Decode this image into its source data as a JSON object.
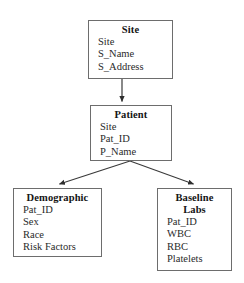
{
  "diagram": {
    "background_color": "#ffffff",
    "line_color": "#3a3a3a",
    "border_color": "#6d6d6d",
    "text_color": "#1a1a1a",
    "entities": [
      {
        "id": "site",
        "title": "Site",
        "title_lines": [
          "Site"
        ],
        "attributes": [
          "Site",
          "S_Name",
          "S_Address"
        ]
      },
      {
        "id": "patient",
        "title": "Patient",
        "title_lines": [
          "Patient"
        ],
        "attributes": [
          "Site",
          "Pat_ID",
          "P_Name"
        ]
      },
      {
        "id": "demographic",
        "title": "Demographic",
        "title_lines": [
          "Demographic"
        ],
        "attributes": [
          "Pat_ID",
          "Sex",
          "Race",
          "Risk Factors"
        ]
      },
      {
        "id": "baseline_labs",
        "title": "Baseline Labs",
        "title_lines": [
          "Baseline",
          "Labs"
        ],
        "attributes": [
          "Pat_ID",
          "WBC",
          "RBC",
          "Platelets"
        ]
      }
    ],
    "edges": [
      {
        "id": "site-to-patient",
        "from": "site",
        "to": "patient",
        "arrowhead": "filled-triangle"
      },
      {
        "id": "patient-to-demographic",
        "from": "patient",
        "to": "demographic",
        "arrowhead": "filled-triangle"
      },
      {
        "id": "patient-to-baseline-labs",
        "from": "patient",
        "to": "baseline_labs",
        "arrowhead": "filled-triangle"
      }
    ]
  }
}
